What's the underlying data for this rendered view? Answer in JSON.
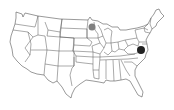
{
  "map": {
    "type": "us-states-outline",
    "background": "#ffffff",
    "outline_color": "#555555",
    "markers": [
      {
        "id": "marker-minnesota",
        "region": "Minnesota",
        "cx": 92,
        "cy": 27,
        "r": 3.5,
        "color": "#808080"
      },
      {
        "id": "marker-virginia",
        "region": "Virginia",
        "cx": 141,
        "cy": 50,
        "r": 4,
        "color": "#222222"
      }
    ]
  }
}
